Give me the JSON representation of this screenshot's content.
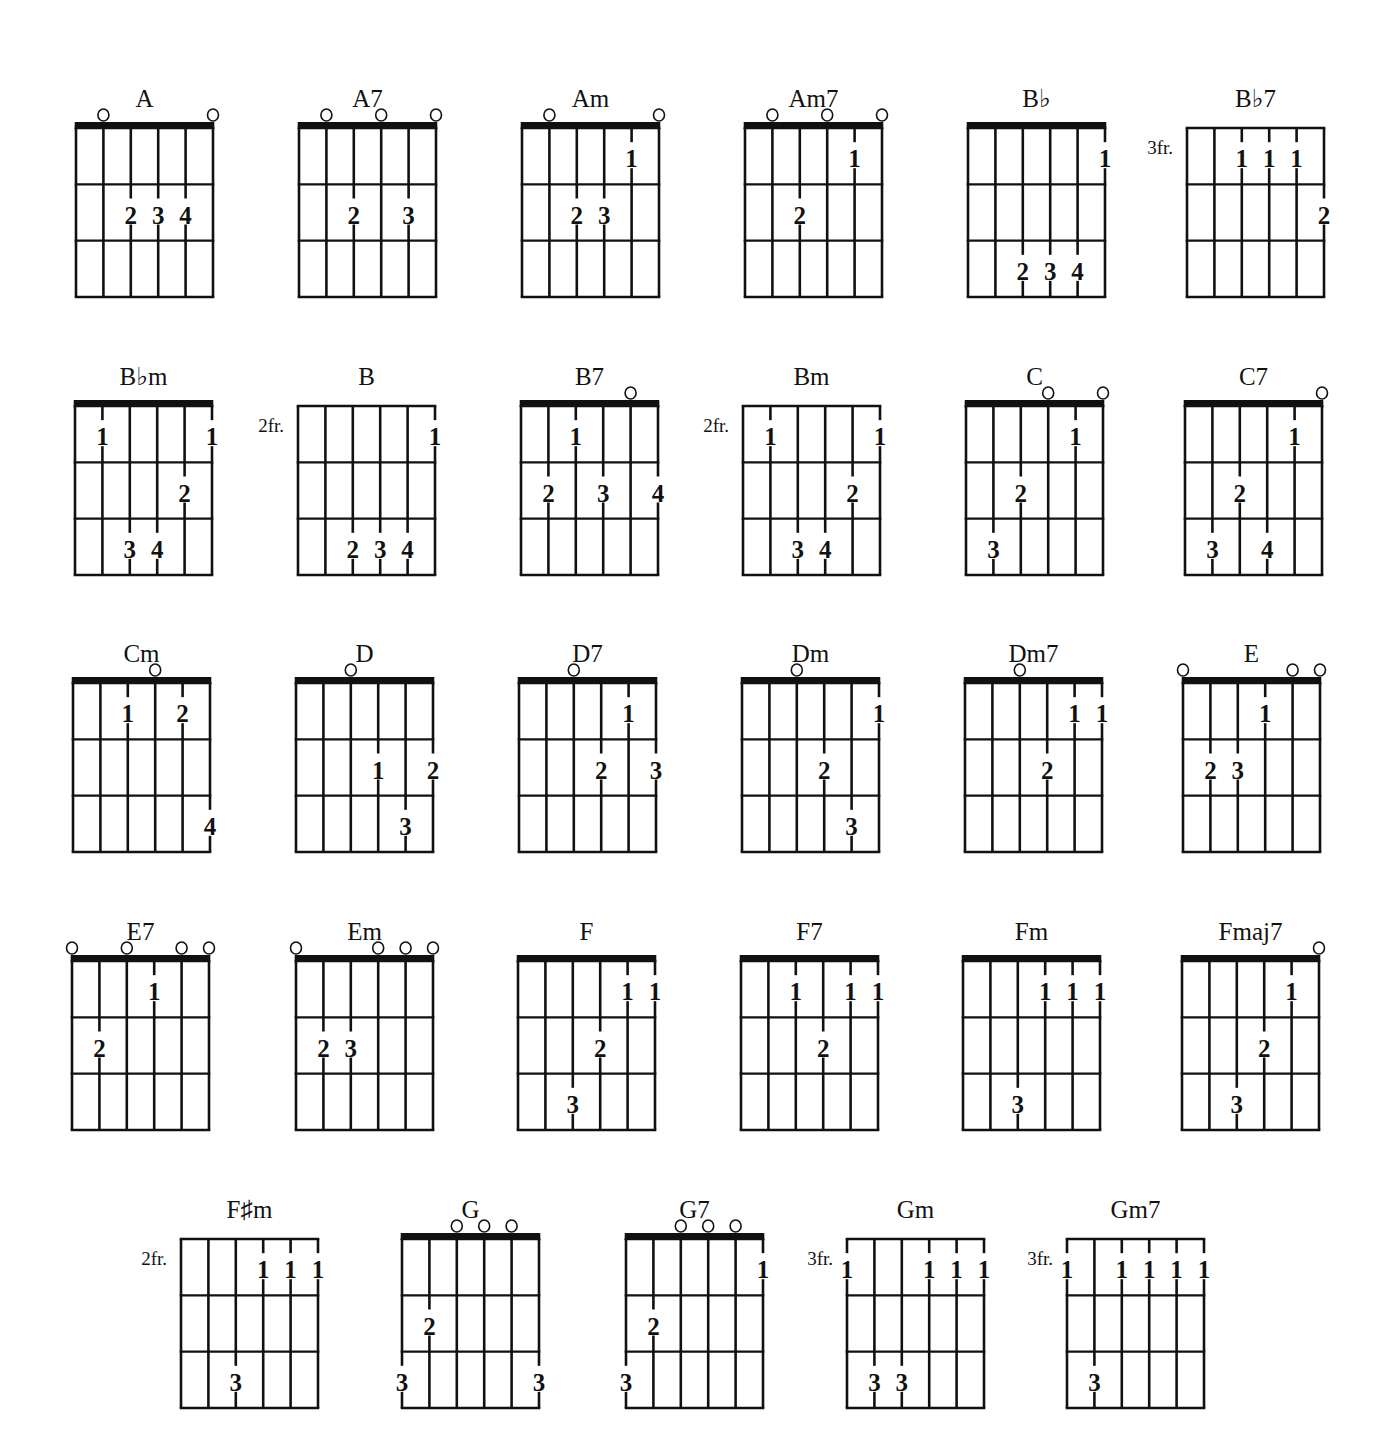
{
  "page": {
    "strings": 6,
    "frets_shown": 3,
    "ink_color": "#111111",
    "background": "#ffffff"
  },
  "chords": [
    {
      "name": "A",
      "row": 0,
      "x": 76,
      "nut": true,
      "position": "",
      "open": [
        1,
        5
      ],
      "fingers": [
        {
          "s": 2,
          "f": 2,
          "n": "2"
        },
        {
          "s": 3,
          "f": 2,
          "n": "3"
        },
        {
          "s": 4,
          "f": 2,
          "n": "4"
        }
      ]
    },
    {
      "name": "A7",
      "row": 0,
      "x": 299,
      "nut": true,
      "position": "",
      "open": [
        1,
        3,
        5
      ],
      "fingers": [
        {
          "s": 2,
          "f": 2,
          "n": "2"
        },
        {
          "s": 4,
          "f": 2,
          "n": "3"
        }
      ]
    },
    {
      "name": "Am",
      "row": 0,
      "x": 522,
      "nut": true,
      "position": "",
      "open": [
        1,
        5
      ],
      "fingers": [
        {
          "s": 4,
          "f": 1,
          "n": "1"
        },
        {
          "s": 2,
          "f": 2,
          "n": "2"
        },
        {
          "s": 3,
          "f": 2,
          "n": "3"
        }
      ]
    },
    {
      "name": "Am7",
      "row": 0,
      "x": 745,
      "nut": true,
      "position": "",
      "open": [
        1,
        3,
        5
      ],
      "fingers": [
        {
          "s": 4,
          "f": 1,
          "n": "1"
        },
        {
          "s": 2,
          "f": 2,
          "n": "2"
        }
      ]
    },
    {
      "name": "B♭",
      "row": 0,
      "x": 968,
      "nut": true,
      "position": "",
      "open": [],
      "fingers": [
        {
          "s": 5,
          "f": 1,
          "n": "1"
        },
        {
          "s": 2,
          "f": 3,
          "n": "2"
        },
        {
          "s": 3,
          "f": 3,
          "n": "3"
        },
        {
          "s": 4,
          "f": 3,
          "n": "4"
        }
      ]
    },
    {
      "name": "B♭7",
      "row": 0,
      "x": 1187,
      "nut": false,
      "position": "3fr.",
      "open": [],
      "fingers": [
        {
          "s": 2,
          "f": 1,
          "n": "1"
        },
        {
          "s": 3,
          "f": 1,
          "n": "1"
        },
        {
          "s": 4,
          "f": 1,
          "n": "1"
        },
        {
          "s": 5,
          "f": 2,
          "n": "2"
        }
      ]
    },
    {
      "name": "B♭m",
      "row": 1,
      "x": 75,
      "nut": true,
      "position": "",
      "open": [],
      "fingers": [
        {
          "s": 1,
          "f": 1,
          "n": "1"
        },
        {
          "s": 5,
          "f": 1,
          "n": "1"
        },
        {
          "s": 4,
          "f": 2,
          "n": "2"
        },
        {
          "s": 2,
          "f": 3,
          "n": "3"
        },
        {
          "s": 3,
          "f": 3,
          "n": "4"
        }
      ]
    },
    {
      "name": "B",
      "row": 1,
      "x": 298,
      "nut": false,
      "position": "2fr.",
      "open": [],
      "fingers": [
        {
          "s": 5,
          "f": 1,
          "n": "1"
        },
        {
          "s": 2,
          "f": 3,
          "n": "2"
        },
        {
          "s": 3,
          "f": 3,
          "n": "3"
        },
        {
          "s": 4,
          "f": 3,
          "n": "4"
        }
      ]
    },
    {
      "name": "B7",
      "row": 1,
      "x": 521,
      "nut": true,
      "position": "",
      "open": [
        4
      ],
      "fingers": [
        {
          "s": 2,
          "f": 1,
          "n": "1"
        },
        {
          "s": 1,
          "f": 2,
          "n": "2"
        },
        {
          "s": 3,
          "f": 2,
          "n": "3"
        },
        {
          "s": 5,
          "f": 2,
          "n": "4"
        }
      ]
    },
    {
      "name": "Bm",
      "row": 1,
      "x": 743,
      "nut": false,
      "position": "2fr.",
      "open": [],
      "fingers": [
        {
          "s": 1,
          "f": 1,
          "n": "1"
        },
        {
          "s": 5,
          "f": 1,
          "n": "1"
        },
        {
          "s": 4,
          "f": 2,
          "n": "2"
        },
        {
          "s": 2,
          "f": 3,
          "n": "3"
        },
        {
          "s": 3,
          "f": 3,
          "n": "4"
        }
      ]
    },
    {
      "name": "C",
      "row": 1,
      "x": 966,
      "nut": true,
      "position": "",
      "open": [
        3,
        5
      ],
      "fingers": [
        {
          "s": 4,
          "f": 1,
          "n": "1"
        },
        {
          "s": 2,
          "f": 2,
          "n": "2"
        },
        {
          "s": 1,
          "f": 3,
          "n": "3"
        }
      ]
    },
    {
      "name": "C7",
      "row": 1,
      "x": 1185,
      "nut": true,
      "position": "",
      "open": [
        5
      ],
      "fingers": [
        {
          "s": 4,
          "f": 1,
          "n": "1"
        },
        {
          "s": 2,
          "f": 2,
          "n": "2"
        },
        {
          "s": 1,
          "f": 3,
          "n": "3"
        },
        {
          "s": 3,
          "f": 3,
          "n": "4"
        }
      ]
    },
    {
      "name": "Cm",
      "row": 2,
      "x": 73,
      "nut": true,
      "position": "",
      "open": [
        3
      ],
      "fingers": [
        {
          "s": 2,
          "f": 1,
          "n": "1"
        },
        {
          "s": 4,
          "f": 1,
          "n": "2"
        },
        {
          "s": 5,
          "f": 3,
          "n": "4"
        }
      ]
    },
    {
      "name": "D",
      "row": 2,
      "x": 296,
      "nut": true,
      "position": "",
      "open": [
        2
      ],
      "fingers": [
        {
          "s": 3,
          "f": 2,
          "n": "1"
        },
        {
          "s": 5,
          "f": 2,
          "n": "2"
        },
        {
          "s": 4,
          "f": 3,
          "n": "3"
        }
      ]
    },
    {
      "name": "D7",
      "row": 2,
      "x": 519,
      "nut": true,
      "position": "",
      "open": [
        2
      ],
      "fingers": [
        {
          "s": 4,
          "f": 1,
          "n": "1"
        },
        {
          "s": 3,
          "f": 2,
          "n": "2"
        },
        {
          "s": 5,
          "f": 2,
          "n": "3"
        }
      ]
    },
    {
      "name": "Dm",
      "row": 2,
      "x": 742,
      "nut": true,
      "position": "",
      "open": [
        2
      ],
      "fingers": [
        {
          "s": 5,
          "f": 1,
          "n": "1"
        },
        {
          "s": 3,
          "f": 2,
          "n": "2"
        },
        {
          "s": 4,
          "f": 3,
          "n": "3"
        }
      ]
    },
    {
      "name": "Dm7",
      "row": 2,
      "x": 965,
      "nut": true,
      "position": "",
      "open": [
        2
      ],
      "fingers": [
        {
          "s": 4,
          "f": 1,
          "n": "1"
        },
        {
          "s": 5,
          "f": 1,
          "n": "1"
        },
        {
          "s": 3,
          "f": 2,
          "n": "2"
        }
      ]
    },
    {
      "name": "E",
      "row": 2,
      "x": 1183,
      "nut": true,
      "position": "",
      "open": [
        0,
        4,
        5
      ],
      "fingers": [
        {
          "s": 3,
          "f": 1,
          "n": "1"
        },
        {
          "s": 1,
          "f": 2,
          "n": "2"
        },
        {
          "s": 2,
          "f": 2,
          "n": "3"
        }
      ]
    },
    {
      "name": "E7",
      "row": 3,
      "x": 72,
      "nut": true,
      "position": "",
      "open": [
        0,
        2,
        4,
        5
      ],
      "fingers": [
        {
          "s": 3,
          "f": 1,
          "n": "1"
        },
        {
          "s": 1,
          "f": 2,
          "n": "2"
        }
      ]
    },
    {
      "name": "Em",
      "row": 3,
      "x": 296,
      "nut": true,
      "position": "",
      "open": [
        0,
        3,
        4,
        5
      ],
      "fingers": [
        {
          "s": 1,
          "f": 2,
          "n": "2"
        },
        {
          "s": 2,
          "f": 2,
          "n": "3"
        }
      ]
    },
    {
      "name": "F",
      "row": 3,
      "x": 518,
      "nut": true,
      "position": "",
      "open": [],
      "fingers": [
        {
          "s": 4,
          "f": 1,
          "n": "1"
        },
        {
          "s": 5,
          "f": 1,
          "n": "1"
        },
        {
          "s": 3,
          "f": 2,
          "n": "2"
        },
        {
          "s": 2,
          "f": 3,
          "n": "3"
        }
      ]
    },
    {
      "name": "F7",
      "row": 3,
      "x": 741,
      "nut": true,
      "position": "",
      "open": [],
      "fingers": [
        {
          "s": 2,
          "f": 1,
          "n": "1"
        },
        {
          "s": 4,
          "f": 1,
          "n": "1"
        },
        {
          "s": 5,
          "f": 1,
          "n": "1"
        },
        {
          "s": 3,
          "f": 2,
          "n": "2"
        }
      ]
    },
    {
      "name": "Fm",
      "row": 3,
      "x": 963,
      "nut": true,
      "position": "",
      "open": [],
      "fingers": [
        {
          "s": 3,
          "f": 1,
          "n": "1"
        },
        {
          "s": 4,
          "f": 1,
          "n": "1"
        },
        {
          "s": 5,
          "f": 1,
          "n": "1"
        },
        {
          "s": 2,
          "f": 3,
          "n": "3"
        }
      ]
    },
    {
      "name": "Fmaj7",
      "row": 3,
      "x": 1182,
      "nut": true,
      "position": "",
      "open": [
        5
      ],
      "fingers": [
        {
          "s": 4,
          "f": 1,
          "n": "1"
        },
        {
          "s": 3,
          "f": 2,
          "n": "2"
        },
        {
          "s": 2,
          "f": 3,
          "n": "3"
        }
      ]
    },
    {
      "name": "F♯m",
      "row": 4,
      "x": 181,
      "nut": false,
      "position": "2fr.",
      "open": [],
      "fingers": [
        {
          "s": 3,
          "f": 1,
          "n": "1"
        },
        {
          "s": 4,
          "f": 1,
          "n": "1"
        },
        {
          "s": 5,
          "f": 1,
          "n": "1"
        },
        {
          "s": 2,
          "f": 3,
          "n": "3"
        }
      ]
    },
    {
      "name": "G",
      "row": 4,
      "x": 402,
      "nut": true,
      "position": "",
      "open": [
        2,
        3,
        4
      ],
      "fingers": [
        {
          "s": 1,
          "f": 2,
          "n": "2"
        },
        {
          "s": 0,
          "f": 3,
          "n": "3"
        },
        {
          "s": 5,
          "f": 3,
          "n": "3"
        }
      ]
    },
    {
      "name": "G7",
      "row": 4,
      "x": 626,
      "nut": true,
      "position": "",
      "open": [
        2,
        3,
        4
      ],
      "fingers": [
        {
          "s": 5,
          "f": 1,
          "n": "1"
        },
        {
          "s": 1,
          "f": 2,
          "n": "2"
        },
        {
          "s": 0,
          "f": 3,
          "n": "3"
        }
      ]
    },
    {
      "name": "Gm",
      "row": 4,
      "x": 847,
      "nut": false,
      "position": "3fr.",
      "open": [],
      "fingers": [
        {
          "s": 0,
          "f": 1,
          "n": "1"
        },
        {
          "s": 3,
          "f": 1,
          "n": "1"
        },
        {
          "s": 4,
          "f": 1,
          "n": "1"
        },
        {
          "s": 5,
          "f": 1,
          "n": "1"
        },
        {
          "s": 1,
          "f": 3,
          "n": "3"
        },
        {
          "s": 2,
          "f": 3,
          "n": "3"
        }
      ]
    },
    {
      "name": "Gm7",
      "row": 4,
      "x": 1067,
      "nut": false,
      "position": "3fr.",
      "open": [],
      "fingers": [
        {
          "s": 0,
          "f": 1,
          "n": "1"
        },
        {
          "s": 2,
          "f": 1,
          "n": "1"
        },
        {
          "s": 3,
          "f": 1,
          "n": "1"
        },
        {
          "s": 4,
          "f": 1,
          "n": "1"
        },
        {
          "s": 5,
          "f": 1,
          "n": "1"
        },
        {
          "s": 1,
          "f": 3,
          "n": "3"
        }
      ]
    }
  ],
  "rows": [
    {
      "top": 128
    },
    {
      "top": 406
    },
    {
      "top": 683
    },
    {
      "top": 961
    },
    {
      "top": 1239
    }
  ]
}
